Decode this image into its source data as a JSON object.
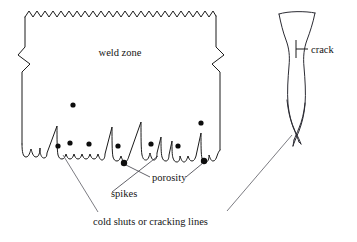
{
  "diagram": {
    "stroke_color": "#1b1b1b",
    "leader_color": "#5a5a62",
    "dot_color": "#0d0d0d",
    "background": "#ffffff",
    "labels": {
      "weld_zone": "weld zone",
      "porosity": "porosity",
      "spikes": "spikes",
      "cold_shuts": "cold shuts or cracking lines",
      "crack": "crack"
    },
    "porosity_points": [
      {
        "cx": 73,
        "cy": 105,
        "r": 2.6
      },
      {
        "cx": 58,
        "cy": 146,
        "r": 2.6
      },
      {
        "cx": 70,
        "cy": 143,
        "r": 2.6
      },
      {
        "cx": 89,
        "cy": 144,
        "r": 2.6
      },
      {
        "cx": 118,
        "cy": 146,
        "r": 2.6
      },
      {
        "cx": 151,
        "cy": 144,
        "r": 2.6
      },
      {
        "cx": 178,
        "cy": 146,
        "r": 2.6
      },
      {
        "cx": 201,
        "cy": 123,
        "r": 2.6
      },
      {
        "cx": 124,
        "cy": 163,
        "r": 3.2
      },
      {
        "cx": 204,
        "cy": 161,
        "r": 3.2
      }
    ],
    "shapes": {
      "weld_block": "rectangular weld zone with sawtooth top edge and break symbols on left and right sides",
      "fusion_boundary": "wavy bottom boundary with tall spikes",
      "weld_nugget": "bullet-shaped weld bead cross-section with pointed double-V root"
    }
  }
}
